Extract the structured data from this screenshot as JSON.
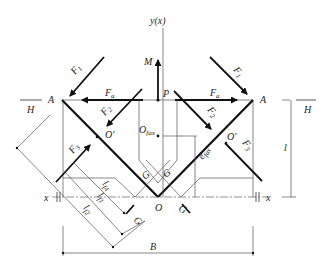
{
  "diagram": {
    "labels": {
      "y_axis": "y(x)",
      "x_axis": "x",
      "moment": "M",
      "point_P": "P",
      "point_A_left": "A",
      "point_A_right": "A",
      "point_O": "O",
      "O_prime_left": "O'",
      "O_prime_right": "O'",
      "O_fax_main": "O",
      "O_fax_sub": "fax",
      "e_fax_main": "e",
      "e_fax_sub": "fax",
      "H_left": "H",
      "H_right": "H",
      "height_dim": "l",
      "width_dim": "B",
      "G_labels": [
        "G",
        "G",
        "G",
        "G"
      ],
      "F1_left": {
        "main": "F",
        "sub": "1"
      },
      "F1_right": {
        "main": "F",
        "sub": "1"
      },
      "F2_left": {
        "main": "F",
        "sub": "2"
      },
      "F2_right": {
        "main": "F",
        "sub": "2"
      },
      "F3_left": {
        "main": "F",
        "sub": "3"
      },
      "F3_right": {
        "main": "F",
        "sub": "3"
      },
      "Fa_left": {
        "main": "F",
        "sub": "a"
      },
      "Fa_right": {
        "main": "F",
        "sub": "a"
      },
      "l_f4": {
        "main": "l",
        "sub": "f4"
      },
      "l_f1": {
        "main": "l",
        "sub": "f1"
      },
      "l_f2": {
        "main": "l",
        "sub": "f2"
      }
    }
  }
}
